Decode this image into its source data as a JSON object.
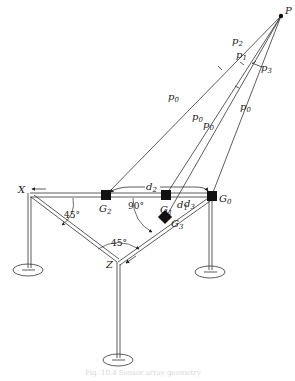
{
  "diagram": {
    "point_label": "P",
    "ray_labels": {
      "p2": {
        "base": "p",
        "sub": "2"
      },
      "p1": {
        "base": "p",
        "sub": "1"
      },
      "p3": {
        "base": "p",
        "sub": "3"
      },
      "p0_a": {
        "base": "p",
        "sub": "0"
      },
      "p0_b": {
        "base": "p",
        "sub": "0"
      },
      "p0_c": {
        "base": "p",
        "sub": "0"
      },
      "p0_d": {
        "base": "p",
        "sub": "0"
      }
    },
    "axis_labels": {
      "x": "X",
      "z": "Z"
    },
    "sensors": {
      "g0": {
        "base": "G",
        "sub": "0"
      },
      "g1": {
        "base": "G",
        "sub": "1"
      },
      "g2": {
        "base": "G",
        "sub": "2"
      },
      "g3": {
        "base": "G",
        "sub": "3"
      }
    },
    "distances": {
      "d1": {
        "base": "d",
        "sub": "1"
      },
      "d2": {
        "base": "d",
        "sub": "2"
      },
      "d3": {
        "base": "d",
        "sub": "3"
      }
    },
    "angles": {
      "left": "45°",
      "bottom": "45°",
      "right": "90°"
    },
    "caption": "Fig. 10.4 Sensor array geometry"
  }
}
